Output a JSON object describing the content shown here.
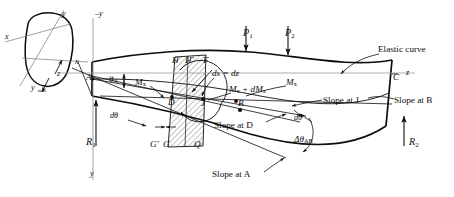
{
  "figure": {
    "type": "engineering-diagram",
    "background": "#ffffff",
    "ink": "#0d0d0d",
    "hatch_color": "#555555"
  },
  "loads": [
    {
      "name": "P1",
      "symbol": "P",
      "subscript": "1",
      "x": 246,
      "y": 32
    },
    {
      "name": "P2",
      "symbol": "P",
      "subscript": "2",
      "x": 288,
      "y": 32
    }
  ],
  "reactions": [
    {
      "name": "R1",
      "symbol": "R",
      "subscript": "1",
      "x": 89,
      "y": 142
    },
    {
      "name": "R2",
      "symbol": "R",
      "subscript": "2",
      "x": 412,
      "y": 142
    }
  ],
  "points": [
    {
      "id": "A",
      "label": "A",
      "x": 92,
      "y": 76
    },
    {
      "id": "B",
      "label": "B",
      "x": 241,
      "y": 104
    },
    {
      "id": "C",
      "label": "C",
      "x": 396,
      "y": 79
    },
    {
      "id": "D",
      "label": "D",
      "x": 172,
      "y": 103
    },
    {
      "id": "F",
      "label": "F",
      "x": 206,
      "y": 63
    },
    {
      "id": "H",
      "label": "H",
      "x": 175,
      "y": 62
    },
    {
      "id": "Hprime",
      "label": "H'",
      "x": 188,
      "y": 62
    },
    {
      "id": "J",
      "label": "J",
      "x": 203,
      "y": 104
    },
    {
      "id": "G",
      "label": "G",
      "x": 166,
      "y": 142
    },
    {
      "id": "Gprime",
      "label": "G'",
      "x": 155,
      "y": 142
    },
    {
      "id": "Q",
      "label": "Q",
      "x": 198,
      "y": 142
    }
  ],
  "moments": [
    {
      "name": "Mx-left",
      "text": "M",
      "sub": "x",
      "x": 139,
      "y": 83
    },
    {
      "name": "Mx-right",
      "text": "M",
      "sub": "x",
      "x": 289,
      "y": 83
    },
    {
      "name": "Mx-plus-dMx",
      "text": "M",
      "sub": "x",
      "tail": " + dM",
      "tail_sub": "x",
      "x": 233,
      "y": 90
    }
  ],
  "annotations": {
    "ds_dz": {
      "text": "ds = dz",
      "x": 216,
      "y": 74
    },
    "theta_A": {
      "text": "θ",
      "sub": "A",
      "x": 113,
      "y": 80
    },
    "d_theta_left": {
      "text": "dθ",
      "x": 113,
      "y": 117
    },
    "d_theta_right": {
      "text": "dθ",
      "x": 297,
      "y": 119
    },
    "delta_theta_AB": {
      "text": "Δθ",
      "sub": "AB",
      "x": 299,
      "y": 140
    },
    "elastic_curve": {
      "text": "Elastic curve",
      "x": 381,
      "y": 50
    },
    "slope_at_B": {
      "text": "Slope at B",
      "x": 396,
      "y": 101
    },
    "slope_at_J": {
      "text": "Slope at J",
      "x": 325,
      "y": 101
    },
    "slope_at_D": {
      "text": "Slope at D",
      "x": 217,
      "y": 126
    },
    "slope_at_A": {
      "text": "Slope at A",
      "x": 215,
      "y": 175
    }
  },
  "axes": [
    {
      "name": "minus-y-section",
      "text": "–y",
      "x": 62,
      "y": 14
    },
    {
      "name": "minus-y-beam",
      "text": "–y",
      "x": 99,
      "y": 14
    },
    {
      "name": "x-section",
      "text": "x",
      "x": 8,
      "y": 37
    },
    {
      "name": "x-right-section",
      "text": "x",
      "x": 78,
      "y": 62
    },
    {
      "name": "y-section-lower",
      "text": "y",
      "x": 34,
      "y": 88
    },
    {
      "name": "z-axis-label",
      "text": "z",
      "x": 60,
      "y": 74
    },
    {
      "name": "y-axis-down",
      "text": "y",
      "x": 93,
      "y": 174
    },
    {
      "name": "z-axis-right",
      "text": "z",
      "x": 409,
      "y": 73
    }
  ],
  "cross_section": {
    "name": "beam-cross-section",
    "center_x": 46,
    "center_y": 48
  }
}
